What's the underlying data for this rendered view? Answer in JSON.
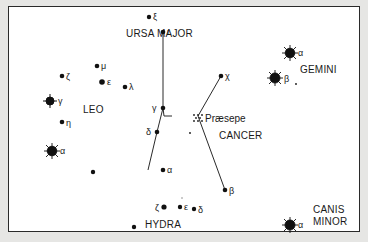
{
  "diagram": {
    "colors": {
      "background": "#e6e6e4",
      "panel": "#ffffff",
      "ink": "#1a1a1a"
    },
    "constellations": [
      {
        "name": "URSA MAJOR"
      },
      {
        "name": "LEO"
      },
      {
        "name": "GEMINI"
      },
      {
        "name": "CANCER"
      },
      {
        "name": "HYDRA"
      },
      {
        "name": "CANIS",
        "line2": "MINOR"
      }
    ],
    "cluster": {
      "name": "Præsepe"
    },
    "stars": {
      "uma_xi": "ξ",
      "leo_mu": "μ",
      "leo_zeta": "ζ",
      "leo_epsilon": "ε",
      "leo_lambda": "λ",
      "leo_gamma": "γ",
      "leo_eta": "η",
      "leo_alpha": "α",
      "gem_alpha": "α",
      "gem_beta": "β",
      "cnc_iota": "ι",
      "cnc_chi": "χ",
      "cnc_gamma": "γ",
      "cnc_delta": "δ",
      "cnc_alpha": "α",
      "cnc_beta": "β",
      "hya_zeta": "ζ",
      "hya_epsilon": "ε",
      "hya_delta": "δ",
      "cmi_alpha": "α"
    }
  }
}
